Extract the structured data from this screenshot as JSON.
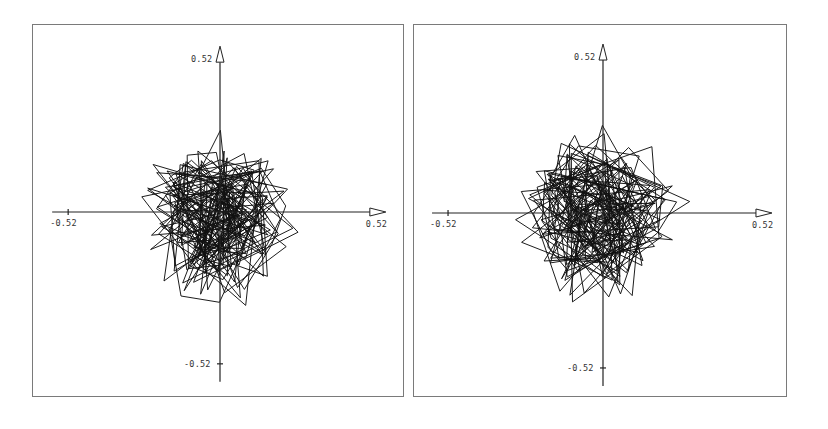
{
  "chart_data": [
    {
      "type": "line",
      "title": "",
      "xlabel": "",
      "ylabel": "",
      "xlim": [
        -0.52,
        0.52
      ],
      "ylim": [
        -0.52,
        0.52
      ],
      "grid": false,
      "legend": null,
      "tick_labels": {
        "x_min": "-0.52",
        "x_max": "0.52",
        "y_min": "-0.52",
        "y_max": "0.52"
      },
      "description": "Phase-plane trajectory (dense random-walk polyline) centered near origin, spanning roughly x in [-0.34, 0.34], y in [-0.38, 0.37]",
      "extent": {
        "x": [
          -0.34,
          0.34
        ],
        "y": [
          -0.38,
          0.37
        ]
      },
      "generator": {
        "seed": 17,
        "segments": 230,
        "rx": 0.31,
        "ry": 0.33,
        "cx": 0.0,
        "cy": -0.01
      }
    },
    {
      "type": "line",
      "title": "",
      "xlabel": "",
      "ylabel": "",
      "xlim": [
        -0.52,
        0.52
      ],
      "ylim": [
        -0.52,
        0.52
      ],
      "grid": false,
      "legend": null,
      "tick_labels": {
        "x_min": "-0.52",
        "x_max": "0.52",
        "y_min": "-0.52",
        "y_max": "0.52"
      },
      "description": "Phase-plane trajectory (dense random-walk polyline) centered near origin, spanning roughly x in [-0.37, 0.36], y in [-0.36, 0.36]",
      "extent": {
        "x": [
          -0.37,
          0.36
        ],
        "y": [
          -0.36,
          0.36
        ]
      },
      "generator": {
        "seed": 53,
        "segments": 240,
        "rx": 0.33,
        "ry": 0.32,
        "cx": -0.01,
        "cy": 0.0
      }
    }
  ],
  "panels": [
    {
      "frame": {
        "left": 32,
        "top": 24,
        "width": 372,
        "height": 373
      },
      "origin": {
        "x": 187,
        "y": 187
      },
      "scale": 292,
      "labels": {
        "x_min": "-0.52",
        "x_max": "0.52",
        "y_min": "-0.52",
        "y_max": "0.52"
      }
    },
    {
      "frame": {
        "left": 413,
        "top": 24,
        "width": 374,
        "height": 373
      },
      "origin": {
        "x": 189,
        "y": 188
      },
      "scale": 298,
      "labels": {
        "x_min": "-0.52",
        "x_max": "0.52",
        "y_min": "-0.52",
        "y_max": "0.52"
      }
    }
  ]
}
